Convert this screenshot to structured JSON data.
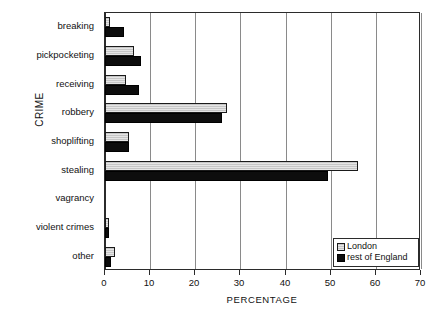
{
  "chart_data": {
    "type": "bar",
    "orientation": "horizontal",
    "title": "",
    "xlabel": "PERCENTAGE",
    "ylabel": "CRIME",
    "xlim": [
      0,
      70
    ],
    "xticks": [
      0,
      10,
      20,
      30,
      40,
      50,
      60,
      70
    ],
    "grid": "vertical",
    "legend_position": "bottom-right",
    "categories": [
      "breaking",
      "pickpocketing",
      "receiving",
      "robbery",
      "shoplifting",
      "stealing",
      "vagrancy",
      "violent crimes",
      "other"
    ],
    "series": [
      {
        "name": "London",
        "color": "#c6c6c6",
        "values": [
          1.0,
          6.5,
          4.7,
          27.0,
          5.3,
          56.0,
          0.0,
          0.8,
          2.2
        ]
      },
      {
        "name": "rest of England",
        "color": "#0d0d0d",
        "values": [
          4.2,
          8.0,
          7.5,
          26.0,
          5.3,
          49.5,
          0.0,
          0.9,
          1.4
        ]
      }
    ]
  },
  "legend": {
    "items": [
      {
        "label": "London"
      },
      {
        "label": "rest of England"
      }
    ]
  },
  "axes": {
    "x_title": "PERCENTAGE",
    "y_title": "CRIME",
    "x_tick_labels": [
      "0",
      "10",
      "20",
      "30",
      "40",
      "50",
      "60",
      "70"
    ]
  }
}
